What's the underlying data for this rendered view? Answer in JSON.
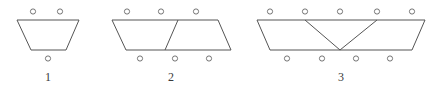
{
  "figure": {
    "type": "geometric-sequence-diagram",
    "stroke_color": "#555555",
    "circle_stroke_color": "#666666",
    "background_color": "#ffffff",
    "label_color": "#3a3a3a",
    "stroke_width": 1,
    "circle_radius": 2.6,
    "top_edge_y": 20,
    "bottom_edge_y": 50,
    "top_circle_y": 11.5,
    "bottom_circle_y": 58.5,
    "items": [
      {
        "label": "1",
        "label_x": 48,
        "trapezoid_count": 1,
        "top_dots": 2,
        "bottom_dots": 1,
        "outline": [
          [
            17,
            20
          ],
          [
            79,
            20
          ],
          [
            66,
            50
          ],
          [
            31,
            50
          ]
        ],
        "dividers": [],
        "top_circles_x": [
          33,
          60
        ],
        "bottom_circles_x": [
          48
        ]
      },
      {
        "label": "2",
        "label_x": 171,
        "trapezoid_count": 2,
        "top_dots": 3,
        "bottom_dots": 3,
        "outline": [
          [
            112,
            20
          ],
          [
            218,
            20
          ],
          [
            231,
            50
          ],
          [
            126,
            50
          ]
        ],
        "dividers": [
          [
            [
              178,
              20
            ],
            [
              165,
              50
            ]
          ]
        ],
        "top_circles_x": [
          127,
          161,
          196
        ],
        "bottom_circles_x": [
          140,
          175,
          209
        ]
      },
      {
        "label": "3",
        "label_x": 341,
        "trapezoid_count": 3,
        "top_dots": 5,
        "bottom_dots": 4,
        "outline": [
          [
            257,
            20
          ],
          [
            425,
            20
          ],
          [
            412,
            50
          ],
          [
            270,
            50
          ]
        ],
        "dividers": [
          [
            [
              305,
              20
            ],
            [
              340,
              50
            ]
          ],
          [
            [
              377,
              20
            ],
            [
              340,
              50
            ]
          ]
        ],
        "top_circles_x": [
          270,
          305,
          340,
          377,
          412
        ],
        "bottom_circles_x": [
          287,
          322,
          356,
          390
        ]
      }
    ]
  }
}
